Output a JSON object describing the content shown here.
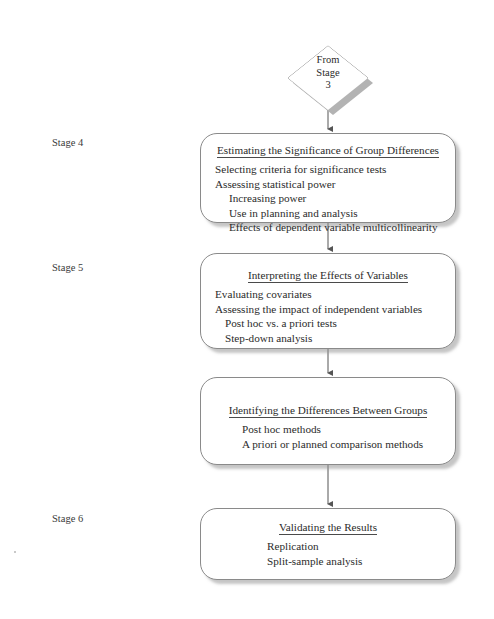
{
  "diagram": {
    "entry_node": {
      "shape": "diamond",
      "lines": [
        "From",
        "Stage",
        "3"
      ]
    },
    "stage_labels": [
      {
        "id": "stage4",
        "text": "Stage 4"
      },
      {
        "id": "stage5",
        "text": "Stage 5"
      },
      {
        "id": "stage6",
        "text": "Stage 6"
      }
    ],
    "nodes": [
      {
        "id": "box1",
        "title": "Estimating the Significance of Group Differences",
        "items": [
          {
            "level": 1,
            "text": "Selecting criteria for significance tests"
          },
          {
            "level": 1,
            "text": "Assessing statistical power"
          },
          {
            "level": 2,
            "text": "Increasing power"
          },
          {
            "level": 2,
            "text": "Use in planning and analysis"
          },
          {
            "level": 2,
            "text": "Effects of dependent variable multicollinearity"
          }
        ]
      },
      {
        "id": "box2",
        "title": "Interpreting the Effects of Variables",
        "items": [
          {
            "level": 1,
            "text": "Evaluating covariates"
          },
          {
            "level": 1,
            "text": "Assessing the impact of independent variables"
          },
          {
            "level": 2,
            "text": "Post hoc vs. a priori tests"
          },
          {
            "level": 2,
            "text": "Step-down analysis"
          }
        ]
      },
      {
        "id": "box3",
        "title": "Identifying the Differences Between Groups",
        "items": [
          {
            "level": 2,
            "text": "Post hoc methods"
          },
          {
            "level": 2,
            "text": "A priori or planned comparison methods"
          }
        ]
      },
      {
        "id": "box4",
        "title": "Validating the Results",
        "items": [
          {
            "level": 2,
            "text": "Replication"
          },
          {
            "level": 2,
            "text": "Split-sample analysis"
          }
        ]
      }
    ],
    "connectors": [
      {
        "from": "entry_node",
        "to": "box1"
      },
      {
        "from": "box1",
        "to": "box2"
      },
      {
        "from": "box2",
        "to": "box3"
      },
      {
        "from": "box3",
        "to": "box4"
      }
    ],
    "colors": {
      "node_border": "#8a8a8a",
      "node_fill": "#ffffff",
      "shadow": "#b3b3b3",
      "connector": "#555555",
      "text": "#2b2b2b",
      "background": "#ffffff"
    }
  }
}
